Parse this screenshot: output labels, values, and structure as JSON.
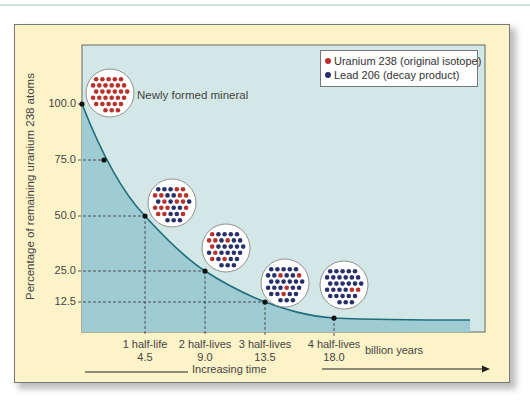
{
  "figure": {
    "legend": {
      "items": [
        {
          "label": "Uranium 238 (original isotope)",
          "color": "#b8312a"
        },
        {
          "label": "Lead 206 (decay product)",
          "color": "#27306b"
        }
      ]
    },
    "annotation": "Newly formed mineral",
    "y_axis_label": "Percentage of remaining uranium 238 atoms",
    "y_ticks": [
      "100.0",
      "75.0",
      "50.0",
      "25.0",
      "12.5"
    ],
    "x_ticks": [
      {
        "line1": "1 half-life",
        "line2": "4.5"
      },
      {
        "line1": "2 half-lives",
        "line2": "9.0"
      },
      {
        "line1": "3 half-lives",
        "line2": "13.5"
      },
      {
        "line1": "4 half-lives",
        "line2": "18.0"
      }
    ],
    "x_unit": "billion years",
    "time_arrow_label": "Increasing time",
    "colors": {
      "panel": "#fdf3c8",
      "plot_bg": "#d3e8e6",
      "area_fill": "#9fcbd2",
      "curve": "#1f6d7c",
      "uranium": "#b8312a",
      "lead": "#27306b"
    }
  },
  "chart_data": {
    "type": "line",
    "title": "",
    "xlabel": "billion years (Increasing time)",
    "ylabel": "Percentage of remaining uranium 238 atoms",
    "x": [
      0,
      4.5,
      9.0,
      13.5,
      18.0
    ],
    "x_tick_labels": [
      "1 half-life 4.5",
      "2 half-lives 9.0",
      "3 half-lives 13.5",
      "4 half-lives 18.0"
    ],
    "series": [
      {
        "name": "Uranium 238 remaining (%)",
        "values": [
          100.0,
          50.0,
          25.0,
          12.5,
          6.25
        ]
      }
    ],
    "marked_points": [
      {
        "x": 0,
        "y": 100.0
      },
      {
        "x": 2.25,
        "y": 75.0
      },
      {
        "x": 4.5,
        "y": 50.0
      },
      {
        "x": 9.0,
        "y": 25.0
      },
      {
        "x": 13.5,
        "y": 12.5
      },
      {
        "x": 18.0,
        "y": 6.25
      }
    ],
    "y_ticks": [
      100.0,
      75.0,
      50.0,
      25.0,
      12.5
    ],
    "legend": [
      "Uranium 238 (original isotope)",
      "Lead 206 (decay product)"
    ],
    "annotations": [
      "Newly formed mineral"
    ],
    "grid": false,
    "legend_position": "upper right"
  }
}
